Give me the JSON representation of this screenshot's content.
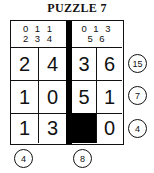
{
  "title": "PUZZLE 7",
  "header": {
    "left": {
      "line1": "0 1 1",
      "line2": "2 3 4"
    },
    "right": {
      "line1": "0 1 3",
      "line2": "5 6"
    }
  },
  "grid": {
    "rows": [
      [
        "2",
        "4",
        "3",
        "6"
      ],
      [
        "1",
        "0",
        "5",
        "1"
      ],
      [
        "1",
        "3",
        "",
        "0"
      ]
    ],
    "black_cells": [
      [
        2,
        2
      ]
    ]
  },
  "row_clues": [
    "15",
    "7",
    "4"
  ],
  "column_clues": [
    "4",
    "8"
  ]
}
